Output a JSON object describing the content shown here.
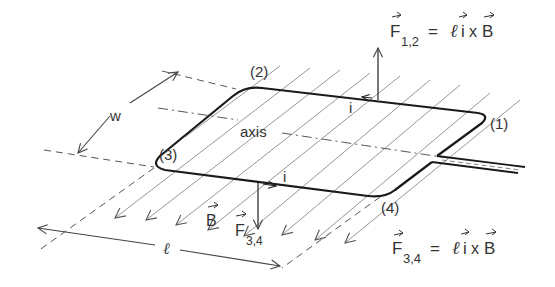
{
  "diagram": {
    "type": "physics-diagram",
    "labels": {
      "corner_1": "(1)",
      "corner_2": "(2)",
      "corner_3": "(3)",
      "corner_4": "(4)",
      "axis": "axis",
      "width": "w",
      "length": "ℓ",
      "current_top": "i",
      "current_bottom": "i",
      "field": "B",
      "force_top_main": "F",
      "force_top_sub": "1,2",
      "force_bottom_main": "F",
      "force_bottom_sub": "3,4"
    },
    "equations": {
      "top": {
        "lhs_main": "F",
        "lhs_sub": "1,2",
        "eq": "=",
        "rhs_l": "ℓ",
        "rhs_i": "i",
        "rhs_x": "x",
        "rhs_B": "B"
      },
      "bottom": {
        "lhs_main": "F",
        "lhs_sub": "3,4",
        "eq": "=",
        "rhs_l": "ℓ",
        "rhs_i": "i",
        "rhs_x": "x",
        "rhs_B": "B"
      }
    },
    "colors": {
      "loop": "#1a1a1a",
      "field_lines": "#8a8a8a",
      "text": "#333333",
      "dashed": "#555555"
    }
  }
}
